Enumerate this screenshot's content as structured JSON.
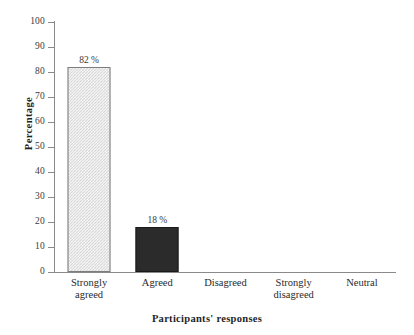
{
  "chart_data": {
    "type": "bar",
    "title": "",
    "xlabel": "Participants' responses",
    "ylabel": "Percentage",
    "categories": [
      "Strongly\nagreed",
      "Agreed",
      "Disagreed",
      "Strongly\ndisagreed",
      "Neutral"
    ],
    "values": [
      82,
      18,
      0,
      0,
      0
    ],
    "data_labels": [
      "82 %",
      "18 %",
      "",
      "",
      ""
    ],
    "ylim": [
      0,
      100
    ],
    "yticks": [
      0,
      10,
      20,
      30,
      40,
      50,
      60,
      70,
      80,
      90,
      100
    ],
    "ytick_labels": [
      "0",
      "10",
      "20",
      "30",
      "40",
      "50",
      "60",
      "70",
      "80",
      "90",
      "100"
    ],
    "grid": false,
    "legend": false,
    "series_styles": [
      "light-gray-checkerboard",
      "solid-dark",
      "none",
      "none",
      "none"
    ]
  },
  "colors": {
    "background": "#ffffff",
    "axis": "#8a8a8a",
    "bar_fill_1": "#d9d9d9",
    "bar_border_1": "#7d7d7d",
    "bar_fill_2": "#2b2b2b",
    "bar_border_2": "#1a1a1a",
    "text": "#2a2a2a",
    "title_text": "#1f1f1f"
  }
}
